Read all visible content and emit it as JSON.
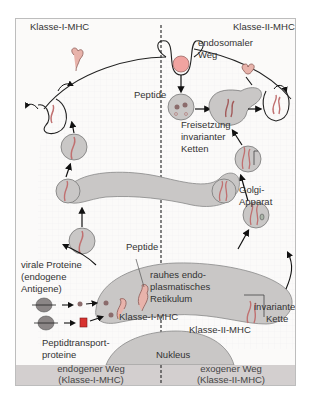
{
  "diagram": {
    "labels": {
      "class1_top": "Klasse-I-MHC",
      "exogenous_antigen": "exogenes Antigen",
      "class2_top": "Klasse-II-MHC",
      "endosomal_path_1": "endosomaler",
      "endosomal_path_2": "Weg",
      "peptide_right": "Peptide",
      "release_1": "Freisetzung",
      "release_2": "invarianter",
      "release_3": "Ketten",
      "golgi_1": "Golgi-",
      "golgi_2": "Apparat",
      "peptide_left": "Peptide",
      "viral_1": "virale Proteine",
      "viral_2": "(endogene",
      "viral_3": "Antigene)",
      "rer_1": "rauhes endo-",
      "rer_2": "plasmatisches",
      "rer_3": "Retikulum",
      "invariant_1": "invariante",
      "invariant_2": "Kette",
      "class1_bottom": "Klasse-I-MHC",
      "class2_bottom": "Klasse-II-MHC",
      "transport_1": "Peptidtransport-",
      "transport_2": "proteine",
      "nucleus": "Nukleus"
    },
    "bottom_band": {
      "left_1": "endogener Weg",
      "left_2": "(Klasse-I-MHC)",
      "right_1": "exogener Weg",
      "right_2": "(Klasse-II-MHC)"
    },
    "colors": {
      "organelle": "#c9c7c6",
      "protein": "#e8b3ab",
      "antigen": "#f0a3a0",
      "band": "#d3cfcf",
      "transporter": "#d8322f"
    }
  }
}
